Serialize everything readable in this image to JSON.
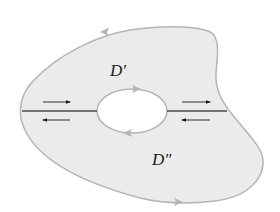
{
  "figure": {
    "colors": {
      "region_fill": "#ebebeb",
      "boundary_stroke": "#b4b4b4",
      "cut_line": "#4a4a4a",
      "arrow": "#1a1a1a",
      "boundary_arrow": "#b4b4b4",
      "hole_fill": "#ffffff",
      "label": "#1a1a1a"
    },
    "labels": {
      "upper_region": "D′",
      "lower_region": "D″"
    },
    "arrows": {
      "outer_boundary": [
        "counterclockwise-top-left",
        "counterclockwise-bottom-right"
      ],
      "hole_boundary": [
        "clockwise-top-right",
        "clockwise-bottom-left"
      ],
      "left_cut": [
        "right-above",
        "left-below"
      ],
      "right_cut": [
        "right-above",
        "left-below"
      ]
    }
  }
}
